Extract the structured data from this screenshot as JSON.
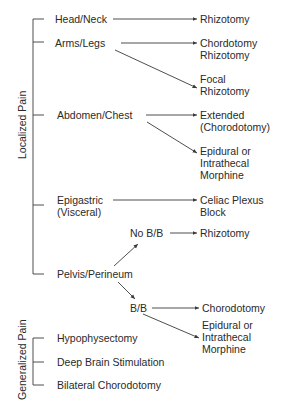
{
  "diagram": {
    "groups": [
      {
        "label": "Localized Pain"
      },
      {
        "label": "Generalized Pain"
      }
    ],
    "localized": {
      "head_neck": {
        "label": "Head/Neck",
        "outcome": "Rhizotomy"
      },
      "arms_legs": {
        "label": "Arms/Legs",
        "outcome1_line1": "Chordotomy",
        "outcome1_line2": "Rhizotomy",
        "outcome2_line1": "Focal",
        "outcome2_line2": "Rhizotomy"
      },
      "abdomen_chest": {
        "label": "Abdomen/Chest",
        "outcome1_line1": "Extended",
        "outcome1_line2": "(Chorodotomy)",
        "outcome2_line1": "Epidural or",
        "outcome2_line2": "Intrathecal",
        "outcome2_line3": "Morphine"
      },
      "epigastric": {
        "label_line1": "Epigastric",
        "label_line2": "(Visceral)",
        "outcome_line1": "Celiac Plexus",
        "outcome_line2": "Block"
      },
      "pelvis_perineum": {
        "label": "Pelvis/Perineum",
        "no_bb": {
          "label": "No B/B",
          "outcome": "Rhizotomy"
        },
        "bb": {
          "label": "B/B",
          "outcome1": "Chorodotomy",
          "outcome2_line1": "Epidural or",
          "outcome2_line2": "Intrathecal",
          "outcome2_line3": "Morphine"
        }
      }
    },
    "generalized": {
      "items": [
        "Hypophysectomy",
        "Deep Brain Stimulation",
        "Bilateral Chorodotomy"
      ]
    },
    "colors": {
      "line": "#3a3a3a",
      "text": "#2a2a2a",
      "background": "#ffffff"
    }
  }
}
